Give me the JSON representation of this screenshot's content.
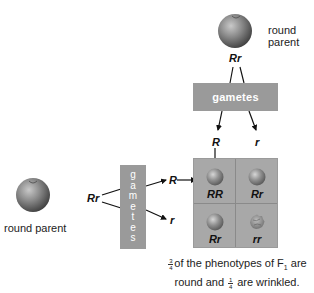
{
  "top_parent": {
    "label_line1": "round",
    "label_line2": "parent",
    "genotype": "Rr"
  },
  "left_parent": {
    "label": "round parent",
    "genotype": "Rr"
  },
  "gametes_horizontal": {
    "label": "gametes",
    "alleles": [
      "R",
      "r"
    ]
  },
  "gametes_vertical": {
    "letters": [
      "g",
      "a",
      "m",
      "e",
      "t",
      "e",
      "s"
    ],
    "alleles": [
      "R",
      "r"
    ]
  },
  "punnett_square": {
    "cells": [
      {
        "genotype": "RR",
        "phenotype": "round"
      },
      {
        "genotype": "Rr",
        "phenotype": "round"
      },
      {
        "genotype": "Rr",
        "phenotype": "round"
      },
      {
        "genotype": "rr",
        "phenotype": "wrinkled"
      }
    ]
  },
  "caption": {
    "frac1_num": "3",
    "frac1_den": "4",
    "part1": "of the phenotypes of F",
    "sub": "1",
    "part2": " are",
    "part3": "round and ",
    "frac2_num": "1",
    "frac2_den": "4",
    "part4": " are wrinkled."
  },
  "colors": {
    "gamete_box": "#9a9a9a",
    "punnett_bg": "#a8a8a8",
    "pea_round": "#8a8a8a"
  }
}
